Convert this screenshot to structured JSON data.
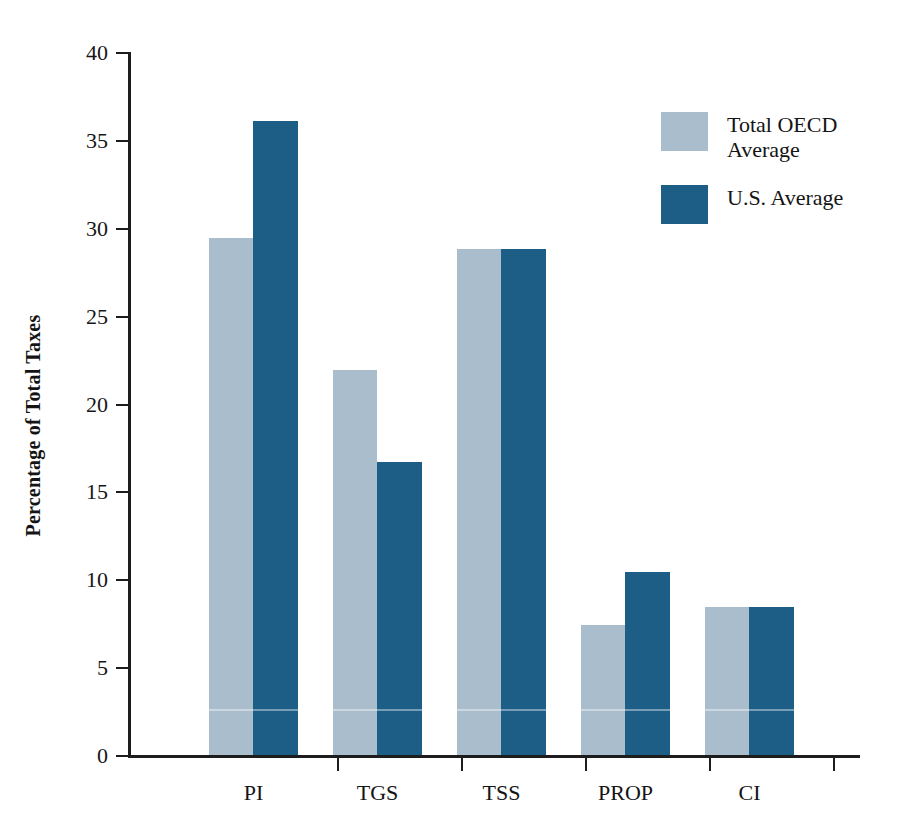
{
  "chart_data": {
    "type": "bar",
    "title": "",
    "xlabel": "",
    "ylabel": "Percentage of Total Taxes",
    "categories": [
      "PI",
      "TGS",
      "TSS",
      "PROP",
      "CI"
    ],
    "series": [
      {
        "name": "Total OECD Average",
        "color": "#a9bdcd",
        "values": [
          29.4,
          21.9,
          28.8,
          7.4,
          8.4
        ]
      },
      {
        "name": "U.S. Average",
        "color": "#1d5e86",
        "values": [
          36.1,
          16.7,
          28.8,
          10.4,
          8.4
        ]
      }
    ],
    "ylim": [
      0,
      40
    ],
    "yticks": [
      0,
      5,
      10,
      15,
      20,
      25,
      30,
      35,
      40
    ],
    "ytick_labels": [
      "0",
      "5",
      "10",
      "15",
      "20",
      "25",
      "30",
      "35",
      "40"
    ],
    "grid": false,
    "legend_position": "top-right"
  },
  "axis": {
    "y_title": "Percentage of Total Taxes"
  },
  "legend": {
    "entries": [
      {
        "label": "Total OECD\nAverage",
        "color": "#a9bdcd"
      },
      {
        "label": "U.S. Average",
        "color": "#1d5e86"
      }
    ]
  },
  "colors": {
    "series_light": "#a9bdcd",
    "series_dark": "#1d5e86",
    "axis": "#1d1d1d",
    "background": "#ffffff"
  }
}
